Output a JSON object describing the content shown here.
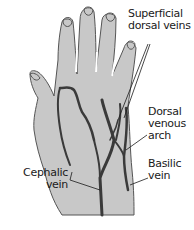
{
  "figure": {
    "colors": {
      "skin": "#c8c8c8",
      "outline": "#555555",
      "vein": "#3a3a3a",
      "text": "#1a1a1a",
      "background": "#ffffff"
    }
  },
  "labels": [
    {
      "id": "superficial-dorsal-veins",
      "lines": [
        "Superficial",
        "dorsal veins"
      ]
    },
    {
      "id": "dorsal-venous-arch",
      "lines": [
        "Dorsal",
        "venous",
        "arch"
      ]
    },
    {
      "id": "basilic-vein",
      "lines": [
        "Basilic",
        "vein"
      ]
    },
    {
      "id": "cephalic-vein",
      "lines": [
        "Cephalic",
        "vein"
      ]
    }
  ]
}
